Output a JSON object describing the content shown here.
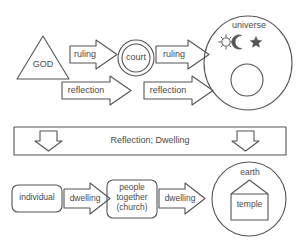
{
  "diagram": {
    "stroke_color": "#555555",
    "text_color": "#4a4a4a",
    "background": "#ffffff",
    "top_row": {
      "source_label": "GOD",
      "source_shape": "triangle",
      "mediator_label": "court",
      "mediator_shape": "double-circle",
      "target_label": "universe",
      "target_shape": "ellipse",
      "arrow_1_label": "ruling",
      "arrow_2_label": "ruling",
      "return_arrow_1_label": "reflection",
      "return_arrow_2_label": "reflection",
      "celestial_icons": [
        "sun-icon",
        "moon-icon",
        "star-icon"
      ]
    },
    "middle_band": {
      "label": "Reflection; Dwelling",
      "left_arrow": "down-arrow-icon",
      "right_arrow": "down-arrow-icon"
    },
    "bottom_row": {
      "node_1_label": "individual",
      "node_2_label_line_1": "people",
      "node_2_label_line_2": "together",
      "node_2_label_line_3": "(church)",
      "arrow_1_label": "dwelling",
      "arrow_2_label": "dwelling",
      "target_outer_label": "earth",
      "target_inner_label": "temple",
      "target_inner_shape": "house"
    }
  }
}
